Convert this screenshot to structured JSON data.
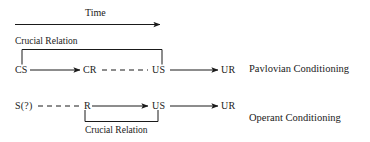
{
  "diagram": {
    "title_axis": "Time",
    "stroke_color": "#1a1a1a",
    "background_color": "#ffffff",
    "rows": [
      {
        "id": "pavlovian",
        "paradigm_label": "Pavlovian Conditioning",
        "bracket_caption": "Crucial Relation",
        "bracket_position": "above",
        "nodes": [
          {
            "id": "cs",
            "label": "CS"
          },
          {
            "id": "cr",
            "label": "CR"
          },
          {
            "id": "us",
            "label": "US"
          },
          {
            "id": "ur",
            "label": "UR"
          }
        ],
        "links": [
          {
            "from": "cs",
            "to": "cr",
            "style": "solid",
            "arrow": true
          },
          {
            "from": "cr",
            "to": "us",
            "style": "dashed",
            "arrow": false
          },
          {
            "from": "us",
            "to": "ur",
            "style": "solid",
            "arrow": true
          }
        ],
        "bracket_span": [
          "cs",
          "us"
        ]
      },
      {
        "id": "operant",
        "paradigm_label": "Operant Conditioning",
        "bracket_caption": "Crucial Relation",
        "bracket_position": "below",
        "nodes": [
          {
            "id": "s",
            "label": "S(?)"
          },
          {
            "id": "r",
            "label": "R"
          },
          {
            "id": "us2",
            "label": "US"
          },
          {
            "id": "ur2",
            "label": "UR"
          }
        ],
        "links": [
          {
            "from": "s",
            "to": "r",
            "style": "dashed",
            "arrow": false
          },
          {
            "from": "r",
            "to": "us2",
            "style": "solid",
            "arrow": true
          },
          {
            "from": "us2",
            "to": "ur2",
            "style": "solid",
            "arrow": true
          }
        ],
        "bracket_span": [
          "r",
          "us2"
        ]
      }
    ]
  }
}
